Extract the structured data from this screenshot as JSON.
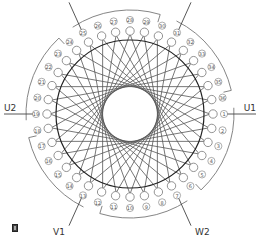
{
  "diagram": {
    "type": "stator-winding-diagram",
    "slot_count": 36,
    "slot_numbers": [
      1,
      2,
      3,
      4,
      5,
      6,
      7,
      8,
      9,
      10,
      11,
      12,
      13,
      14,
      15,
      16,
      17,
      18,
      19,
      20,
      21,
      22,
      23,
      24,
      25,
      26,
      27,
      28,
      29,
      30,
      31,
      32,
      33,
      34,
      35,
      36
    ],
    "chord_span_slots": 14,
    "leads": [
      {
        "label": "U1",
        "slot": 1
      },
      {
        "label": "W2",
        "slot": 7
      },
      {
        "label": "V1",
        "slot": 13
      },
      {
        "label": "U2",
        "slot": 19
      },
      {
        "label": "W1",
        "slot": 25
      },
      {
        "label": "V2",
        "slot": 31
      }
    ],
    "groups": [
      {
        "name": "U1-group",
        "start_slot": 1,
        "end_slot": 5
      },
      {
        "name": "W2-group",
        "start_slot": 7,
        "end_slot": 11
      },
      {
        "name": "V1-group",
        "start_slot": 13,
        "end_slot": 17
      },
      {
        "name": "U2-group",
        "start_slot": 19,
        "end_slot": 23
      },
      {
        "name": "W1-group",
        "start_slot": 25,
        "end_slot": 29
      },
      {
        "name": "V2-group",
        "start_slot": 31,
        "end_slot": 35
      }
    ],
    "colors": {
      "stator_circle": "#222222",
      "chords": "#555555",
      "slot_circle": "#777777",
      "bracket": "#777777",
      "lead_line": "#444444",
      "text": "#333333"
    }
  },
  "corner_icon": "document-icon"
}
